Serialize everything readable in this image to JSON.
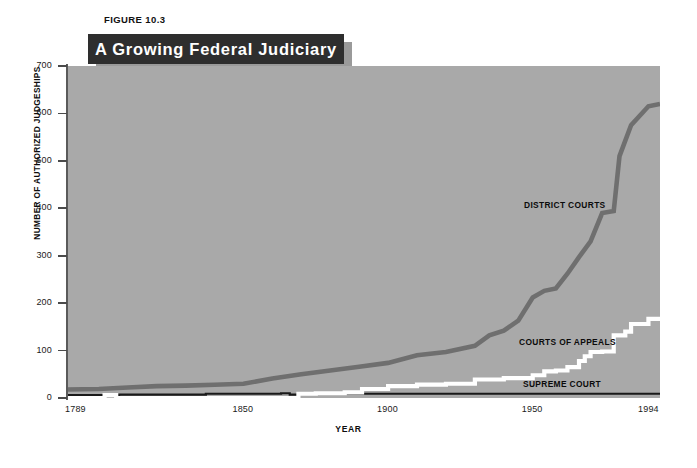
{
  "figure": {
    "number_label": "FIGURE 10.3",
    "title": "A Growing Federal Judiciary"
  },
  "axes": {
    "y_title": "NUMBER OF AUTHORIZED JUDGESHIPS",
    "x_title": "YEAR",
    "y_ticks": [
      "700",
      "600",
      "500",
      "400",
      "300",
      "200",
      "100",
      "0"
    ],
    "x_ticks": [
      "1789",
      "1850",
      "1900",
      "1950",
      "1994"
    ]
  },
  "series_labels": {
    "district_courts": "DISTRICT COURTS",
    "courts_of_appeals": "COURTS OF APPEALS",
    "supreme_court": "SUPREME COURT"
  },
  "colors": {
    "plot_background": "#a9a9a9",
    "district_courts": "#6f6f6f",
    "courts_of_appeals": "#ffffff",
    "supreme_court": "#1a1a1a",
    "banner_background": "#2e2e2e",
    "banner_text": "#ffffff",
    "axis": "#5a5a5a"
  },
  "chart_data": {
    "type": "line",
    "title": "A Growing Federal Judiciary",
    "xlabel": "YEAR",
    "ylabel": "NUMBER OF AUTHORIZED JUDGESHIPS",
    "xlim": [
      1789,
      1994
    ],
    "ylim": [
      0,
      700
    ],
    "y_ticks": [
      0,
      100,
      200,
      300,
      400,
      500,
      600,
      700
    ],
    "x_ticks": [
      1789,
      1850,
      1900,
      1950,
      1994
    ],
    "grid": false,
    "legend": "inline annotations on plot",
    "series": [
      {
        "name": "DISTRICT COURTS",
        "color": "#6f6f6f",
        "points": [
          [
            1789,
            18
          ],
          [
            1800,
            19
          ],
          [
            1810,
            22
          ],
          [
            1820,
            25
          ],
          [
            1830,
            26
          ],
          [
            1840,
            28
          ],
          [
            1850,
            30
          ],
          [
            1860,
            41
          ],
          [
            1870,
            50
          ],
          [
            1880,
            58
          ],
          [
            1890,
            66
          ],
          [
            1900,
            74
          ],
          [
            1910,
            90
          ],
          [
            1920,
            97
          ],
          [
            1930,
            110
          ],
          [
            1935,
            132
          ],
          [
            1940,
            142
          ],
          [
            1945,
            163
          ],
          [
            1950,
            212
          ],
          [
            1954,
            226
          ],
          [
            1958,
            231
          ],
          [
            1962,
            262
          ],
          [
            1966,
            297
          ],
          [
            1970,
            330
          ],
          [
            1974,
            390
          ],
          [
            1978,
            394
          ],
          [
            1980,
            510
          ],
          [
            1984,
            575
          ],
          [
            1990,
            615
          ],
          [
            1994,
            620
          ]
        ]
      },
      {
        "name": "COURTS OF APPEALS",
        "color": "#ffffff",
        "points": [
          [
            1789,
            0
          ],
          [
            1800,
            0
          ],
          [
            1802,
            6
          ],
          [
            1806,
            0
          ],
          [
            1860,
            0
          ],
          [
            1869,
            9
          ],
          [
            1875,
            10
          ],
          [
            1885,
            12
          ],
          [
            1891,
            19
          ],
          [
            1900,
            25
          ],
          [
            1910,
            28
          ],
          [
            1920,
            30
          ],
          [
            1930,
            39
          ],
          [
            1940,
            42
          ],
          [
            1950,
            48
          ],
          [
            1954,
            56
          ],
          [
            1958,
            58
          ],
          [
            1962,
            65
          ],
          [
            1966,
            78
          ],
          [
            1968,
            88
          ],
          [
            1970,
            97
          ],
          [
            1974,
            98
          ],
          [
            1978,
            132
          ],
          [
            1982,
            140
          ],
          [
            1984,
            156
          ],
          [
            1990,
            167
          ],
          [
            1994,
            168
          ]
        ]
      },
      {
        "name": "SUPREME COURT",
        "color": "#1a1a1a",
        "points": [
          [
            1789,
            6
          ],
          [
            1807,
            7
          ],
          [
            1837,
            9
          ],
          [
            1863,
            10
          ],
          [
            1866,
            7
          ],
          [
            1869,
            9
          ],
          [
            1900,
            9
          ],
          [
            1950,
            9
          ],
          [
            1994,
            9
          ]
        ]
      }
    ]
  }
}
